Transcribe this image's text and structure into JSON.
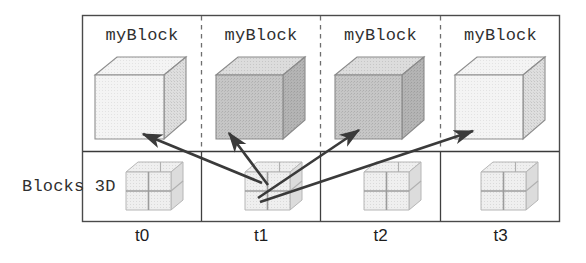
{
  "diagram": {
    "row_labels": {
      "class_row": "Blocks 3D"
    },
    "columns": [
      {
        "id": "t0",
        "time_label": "t0",
        "object_label": "myBlock",
        "object_shade": "light",
        "instance_icon": "subdivided-cube-icon"
      },
      {
        "id": "t1",
        "time_label": "t1",
        "object_label": "myBlock",
        "object_shade": "dark",
        "instance_icon": "subdivided-cube-icon"
      },
      {
        "id": "t2",
        "time_label": "t2",
        "object_label": "myBlock",
        "object_shade": "dark",
        "instance_icon": "subdivided-cube-icon"
      },
      {
        "id": "t3",
        "time_label": "t3",
        "object_label": "myBlock",
        "object_shade": "light",
        "instance_icon": "subdivided-cube-icon"
      }
    ],
    "arrows": [
      {
        "id": "arrow-t1-to-t0",
        "from": "t1",
        "to": "t0",
        "direction": "up-left"
      },
      {
        "id": "arrow-t1-to-t1",
        "from": "t1",
        "to": "t1",
        "direction": "up-left"
      },
      {
        "id": "arrow-t1-to-t2",
        "from": "t1",
        "to": "t2",
        "direction": "up-right"
      },
      {
        "id": "arrow-t1-to-t3",
        "from": "t1",
        "to": "t3",
        "direction": "up-right"
      }
    ],
    "colors": {
      "border": "#4a4a4a",
      "divider": "#3a3a3a",
      "dashed_separator": "#6b6b6b",
      "arrow": "#3a3a3a",
      "cube_light_front": "#f2f2f2",
      "cube_light_top": "#fbfbfb",
      "cube_light_side": "#dcdcdc",
      "cube_dark_front": "#c9c9c9",
      "cube_dark_top": "#e2e2e2",
      "cube_dark_side": "#b3b3b3",
      "small_cube_front": "#ededed",
      "small_cube_top": "#f7f7f7",
      "small_cube_side": "#dfdfdf",
      "text": "#303030"
    }
  }
}
